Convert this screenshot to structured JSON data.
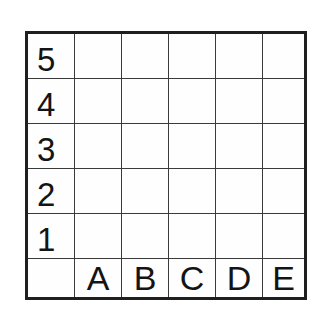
{
  "figure": {
    "name": "coordinate-grid",
    "background_color": "#ffffff",
    "line_color": "#3a3a3a",
    "border_color": "#1f1f1f",
    "text_color": "#141414"
  },
  "grid": {
    "columns": 6,
    "rows": 6,
    "playable_columns": 5,
    "playable_rows": 5,
    "corner_label": "",
    "column_labels": [
      "",
      "A",
      "B",
      "C",
      "D",
      "E"
    ],
    "row_labels": [
      "5",
      "4",
      "3",
      "2",
      "1",
      ""
    ],
    "cells": [
      [
        "5",
        "",
        "",
        "",
        "",
        ""
      ],
      [
        "4",
        "",
        "",
        "",
        "",
        ""
      ],
      [
        "3",
        "",
        "",
        "",
        "",
        ""
      ],
      [
        "2",
        "",
        "",
        "",
        "",
        ""
      ],
      [
        "1",
        "",
        "",
        "",
        "",
        ""
      ],
      [
        "",
        "A",
        "B",
        "C",
        "D",
        "E"
      ]
    ]
  }
}
